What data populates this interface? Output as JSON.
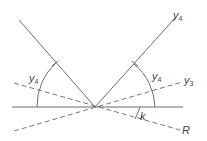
{
  "diagram": {
    "labels": {
      "ray_upper_right": {
        "base": "y",
        "sub": "4"
      },
      "angle_left": {
        "base": "y",
        "sub": "4"
      },
      "angle_right": {
        "base": "y",
        "sub": "4"
      },
      "ray_dashed_upper_right": {
        "base": "y",
        "sub": "3"
      },
      "angle_small": {
        "base": "k",
        "sub": ""
      },
      "ray_dashed_lower_right": {
        "base": "R",
        "sub": ""
      }
    },
    "colors": {
      "line": "#6b6b6b",
      "text": "#444444",
      "background": "#ffffff"
    }
  }
}
